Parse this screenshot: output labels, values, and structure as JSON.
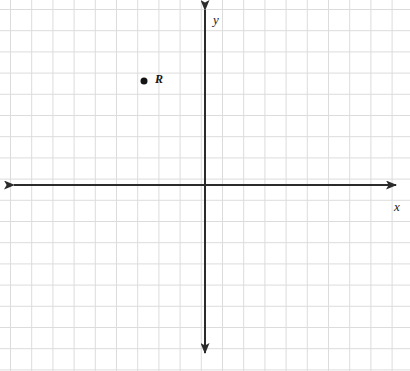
{
  "figure": {
    "width": 410,
    "height": 371,
    "background_color": "#ffffff"
  },
  "grid": {
    "line_color": "#dcdcdc",
    "line_width": 1,
    "cell_size_px": 21.2,
    "origin_px": {
      "x": 205,
      "y": 185
    },
    "first_vertical_line_px": 10,
    "first_horizontal_line_px": 9,
    "visible": true
  },
  "axes": {
    "color": "#2b2b2b",
    "line_width": 2,
    "arrowheads": [
      "left",
      "right",
      "up",
      "down"
    ],
    "x_axis": {
      "label": "x",
      "label_position_px": {
        "x": 394,
        "y": 200
      },
      "y_px": 185,
      "start_px": 14,
      "end_px": 396
    },
    "y_axis": {
      "label": "y",
      "label_position_px": {
        "x": 213,
        "y": 13
      },
      "x_px": 205,
      "start_px": 10,
      "end_px": 353
    }
  },
  "chart_data": {
    "type": "scatter",
    "title": "",
    "xlabel": "x",
    "ylabel": "y",
    "grid": true,
    "legend": "none",
    "xlim": [
      -9.2,
      9
    ],
    "ylim": [
      -8.8,
      8.3
    ],
    "xticks": [],
    "yticks": [],
    "points": [
      {
        "label": "R",
        "x": -3,
        "y": 5,
        "marker": "filled-circle",
        "marker_color": "#141414",
        "marker_radius_px": 3.5,
        "px": {
          "x": 144,
          "y": 81
        },
        "label_px": {
          "x": 155,
          "y": 73
        }
      }
    ]
  }
}
